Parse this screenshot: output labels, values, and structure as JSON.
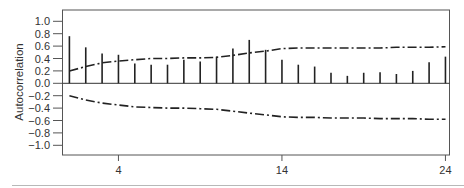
{
  "chart_data": {
    "type": "bar",
    "subtype": "autocorrelation-function (ACF) spike plot with confidence bands",
    "title": "",
    "xlabel": "",
    "ylabel": "Autocorrelation",
    "xlim": [
      1,
      24
    ],
    "ylim": [
      -1.0,
      1.0
    ],
    "grid": false,
    "legend": null,
    "x": [
      1,
      2,
      3,
      4,
      5,
      6,
      7,
      8,
      9,
      10,
      11,
      12,
      13,
      14,
      15,
      16,
      17,
      18,
      19,
      20,
      21,
      22,
      23,
      24
    ],
    "x_ticks": [
      4,
      14,
      24
    ],
    "x_tick_labels": [
      "4",
      "14",
      "24"
    ],
    "y_ticks": [
      1.0,
      0.8,
      0.6,
      0.4,
      0.2,
      0.0,
      -0.2,
      -0.4,
      -0.6,
      -0.8,
      -1.0
    ],
    "y_tick_labels": [
      "1.0",
      "0.8",
      "0.6",
      "0.4",
      "0.2",
      "0.0",
      "−0.2",
      "−0.4",
      "−0.6",
      "−0.8",
      "−1.0"
    ],
    "series": [
      {
        "name": "Autocorrelation",
        "style": "spikes",
        "color": "#222222",
        "values": [
          0.76,
          0.58,
          0.48,
          0.46,
          0.32,
          0.3,
          0.3,
          0.38,
          0.35,
          0.43,
          0.56,
          0.7,
          0.54,
          0.38,
          0.3,
          0.27,
          0.17,
          0.12,
          0.17,
          0.18,
          0.15,
          0.2,
          0.34,
          0.43
        ]
      },
      {
        "name": "Upper confidence band",
        "style": "dash-dot",
        "color": "#222222",
        "values": [
          0.2,
          0.27,
          0.33,
          0.36,
          0.38,
          0.4,
          0.4,
          0.41,
          0.41,
          0.42,
          0.45,
          0.49,
          0.52,
          0.56,
          0.57,
          0.57,
          0.57,
          0.57,
          0.57,
          0.57,
          0.58,
          0.58,
          0.58,
          0.59
        ]
      },
      {
        "name": "Lower confidence band",
        "style": "dash-dot",
        "color": "#222222",
        "values": [
          -0.2,
          -0.27,
          -0.32,
          -0.35,
          -0.38,
          -0.39,
          -0.4,
          -0.4,
          -0.41,
          -0.42,
          -0.45,
          -0.48,
          -0.51,
          -0.54,
          -0.55,
          -0.55,
          -0.56,
          -0.56,
          -0.56,
          -0.57,
          -0.57,
          -0.57,
          -0.58,
          -0.58
        ]
      }
    ]
  }
}
